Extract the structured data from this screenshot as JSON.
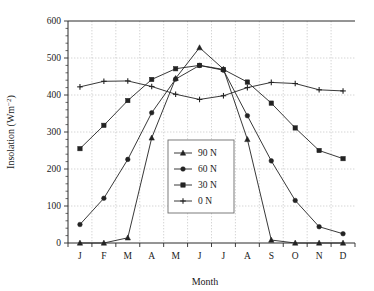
{
  "chart_data": {
    "type": "line",
    "title": "",
    "xlabel": "Month",
    "ylabel": "Insolation (Wm−2)",
    "categories": [
      "J",
      "F",
      "M",
      "A",
      "M",
      "J",
      "J",
      "A",
      "S",
      "O",
      "N",
      "D"
    ],
    "ylim": [
      0,
      600
    ],
    "yticks": [
      0,
      100,
      200,
      300,
      400,
      500,
      600
    ],
    "yticklabels": [
      "0",
      "100",
      "200",
      "300",
      "400",
      "500",
      "600"
    ],
    "y_minor_tick_interval": 20,
    "grid": true,
    "grid_axes": "both",
    "legend_position": "center",
    "series": [
      {
        "name": "90 N",
        "marker": "triangle",
        "values": [
          0,
          0,
          14,
          284,
          445,
          528,
          470,
          280,
          8,
          0,
          0,
          0
        ]
      },
      {
        "name": "60 N",
        "marker": "circle",
        "values": [
          50,
          121,
          226,
          352,
          443,
          480,
          467,
          344,
          222,
          115,
          44,
          25
        ]
      },
      {
        "name": "30 N",
        "marker": "square",
        "values": [
          255,
          318,
          385,
          442,
          471,
          480,
          469,
          435,
          378,
          311,
          250,
          228
        ]
      },
      {
        "name": "0 N",
        "marker": "plus",
        "values": [
          422,
          437,
          438,
          423,
          402,
          388,
          398,
          420,
          434,
          431,
          414,
          411
        ]
      }
    ]
  },
  "axis": {
    "y_title": "Insolation (Wm",
    "y_title_exponent": "−2",
    "y_title_close": ")",
    "x_title": "Month"
  }
}
